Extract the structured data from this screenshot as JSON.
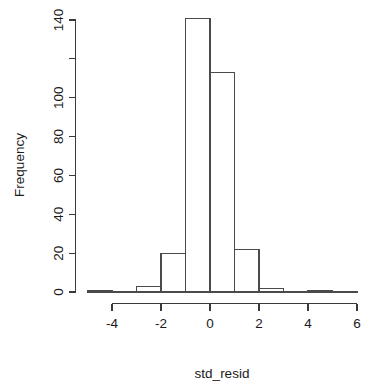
{
  "chart_data": {
    "type": "bar",
    "subtype": "histogram",
    "title": "",
    "xlabel": "std_resid",
    "ylabel": "Frequency",
    "xlim": [
      -5,
      6
    ],
    "ylim": [
      0,
      141
    ],
    "grid": false,
    "legend": null,
    "bin_width": 1,
    "bin_edges": [
      -5,
      -4,
      -3,
      -2,
      -1,
      0,
      1,
      2,
      3,
      4,
      5,
      6
    ],
    "categories": [
      "-5 to -4",
      "-4 to -3",
      "-3 to -2",
      "-2 to -1",
      "-1 to 0",
      "0 to 1",
      "1 to 2",
      "2 to 3",
      "3 to 4",
      "4 to 5",
      "5 to 6"
    ],
    "values": [
      1,
      0,
      3,
      20,
      141,
      113,
      22,
      2,
      0,
      1,
      0
    ],
    "x_axis": {
      "ticks": [
        -4,
        -2,
        0,
        2,
        4,
        6
      ],
      "tick_labels": [
        "-4",
        "-2",
        "0",
        "2",
        "4",
        "6"
      ],
      "range": [
        -4,
        6
      ]
    },
    "y_axis": {
      "ticks": [
        0,
        20,
        40,
        60,
        80,
        100,
        120,
        140
      ],
      "tick_labels": [
        "0",
        "20",
        "40",
        "60",
        "80",
        "100",
        "",
        "140"
      ],
      "range": [
        0,
        140
      ]
    },
    "colors": {
      "bar_fill": "#ffffff",
      "bar_stroke": "#4a4a4a",
      "axis": "#3a3a3a",
      "text": "#1a1a1a",
      "background": "#ffffff"
    }
  },
  "labels": {
    "x_axis_title": "std_resid",
    "y_axis_title": "Frequency"
  }
}
